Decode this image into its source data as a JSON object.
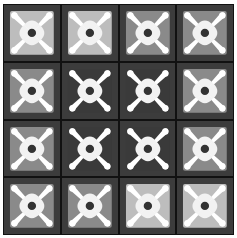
{
  "grid": {
    "rows": 4,
    "cols": 4,
    "cell_frame_color": "#3c3c3c",
    "grid_line_color": "#111111",
    "motif": {
      "petal_color": "#f2f2f2",
      "spoke_color": "#ffffff",
      "center_dot_color": "#333333"
    },
    "shades": {
      "light": "#bdbdbd",
      "medium": "#8a8a8a",
      "dark": "#3a3a3a"
    },
    "cells": [
      {
        "row": 0,
        "col": 0,
        "shade": "light"
      },
      {
        "row": 0,
        "col": 1,
        "shade": "light"
      },
      {
        "row": 0,
        "col": 2,
        "shade": "medium"
      },
      {
        "row": 0,
        "col": 3,
        "shade": "medium"
      },
      {
        "row": 1,
        "col": 0,
        "shade": "medium"
      },
      {
        "row": 1,
        "col": 1,
        "shade": "dark"
      },
      {
        "row": 1,
        "col": 2,
        "shade": "dark"
      },
      {
        "row": 1,
        "col": 3,
        "shade": "medium"
      },
      {
        "row": 2,
        "col": 0,
        "shade": "medium"
      },
      {
        "row": 2,
        "col": 1,
        "shade": "dark"
      },
      {
        "row": 2,
        "col": 2,
        "shade": "dark"
      },
      {
        "row": 2,
        "col": 3,
        "shade": "medium"
      },
      {
        "row": 3,
        "col": 0,
        "shade": "medium"
      },
      {
        "row": 3,
        "col": 1,
        "shade": "medium"
      },
      {
        "row": 3,
        "col": 2,
        "shade": "light"
      },
      {
        "row": 3,
        "col": 3,
        "shade": "light"
      }
    ]
  }
}
